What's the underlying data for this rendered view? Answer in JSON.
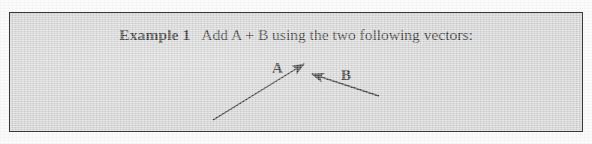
{
  "document": {
    "figure_kind": "textbook-example-box",
    "background_color": "#fbfbfb",
    "panel_fill": "#d5d5d5",
    "panel_border_color": "#3a3a3a",
    "ink_color": "#1e1e1e"
  },
  "example": {
    "label": "Example 1",
    "prompt": "Add A + B using the two following vectors:"
  },
  "vectors": [
    {
      "name": "A",
      "label": "A",
      "tail": [
        203,
        107
      ],
      "head": [
        294,
        51
      ],
      "label_position": [
        262,
        47
      ]
    },
    {
      "name": "B",
      "label": "B",
      "tail": [
        369,
        83
      ],
      "head": [
        302,
        61
      ],
      "label_position": [
        331,
        54
      ]
    }
  ]
}
